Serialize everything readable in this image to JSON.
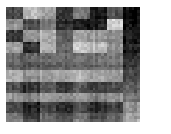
{
  "figure": {
    "background_color": "#ffffff",
    "plot_area": {
      "left": 6,
      "top": 7,
      "width": 134,
      "height": 115
    },
    "title": "",
    "xlabel": "",
    "ylabel": ""
  },
  "chart_data": {
    "type": "heatmap",
    "title": "",
    "subtitle": "",
    "xlabel": "",
    "ylabel": "",
    "grid": false,
    "legend": "none",
    "colormap": "gray",
    "vmin": 0,
    "vmax": 1,
    "n_rows": 40,
    "n_cols": 48,
    "xtick_labels": [],
    "ytick_labels": [],
    "annotations": [],
    "row_bands": [
      {
        "index": 0,
        "rows": [
          0,
          3
        ],
        "label": "band-1"
      },
      {
        "index": 1,
        "rows": [
          4,
          7
        ],
        "label": "band-2"
      },
      {
        "index": 2,
        "rows": [
          8,
          11
        ],
        "label": "band-3"
      },
      {
        "index": 3,
        "rows": [
          12,
          15
        ],
        "label": "band-4"
      },
      {
        "index": 4,
        "rows": [
          16,
          18
        ],
        "label": "band-5"
      },
      {
        "index": 5,
        "rows": [
          19,
          21
        ],
        "label": "band-6"
      },
      {
        "index": 6,
        "rows": [
          22,
          25
        ],
        "label": "band-7"
      },
      {
        "index": 7,
        "rows": [
          26,
          29
        ],
        "label": "band-8"
      },
      {
        "index": 8,
        "rows": [
          30,
          32
        ],
        "label": "band-9"
      },
      {
        "index": 9,
        "rows": [
          33,
          36
        ],
        "label": "band-10"
      },
      {
        "index": 10,
        "rows": [
          37,
          39
        ],
        "label": "band-11"
      }
    ],
    "col_blocks": [
      {
        "index": 0,
        "cols": [
          0,
          5
        ],
        "label": "block-1"
      },
      {
        "index": 1,
        "cols": [
          6,
          11
        ],
        "label": "block-2"
      },
      {
        "index": 2,
        "cols": [
          12,
          17
        ],
        "label": "block-3"
      },
      {
        "index": 3,
        "cols": [
          18,
          23
        ],
        "label": "block-4"
      },
      {
        "index": 4,
        "cols": [
          24,
          29
        ],
        "label": "block-5"
      },
      {
        "index": 5,
        "cols": [
          30,
          35
        ],
        "label": "block-6"
      },
      {
        "index": 6,
        "cols": [
          36,
          41
        ],
        "label": "block-7"
      },
      {
        "index": 7,
        "cols": [
          42,
          47
        ],
        "label": "block-8-dark"
      }
    ],
    "block_values": [
      [
        0.28,
        0.72,
        0.62,
        0.18,
        0.45,
        0.08,
        0.3,
        0.05
      ],
      [
        0.55,
        0.3,
        0.48,
        0.17,
        0.1,
        0.12,
        0.8,
        0.06
      ],
      [
        0.22,
        0.58,
        0.68,
        0.35,
        0.62,
        0.6,
        0.52,
        0.1
      ],
      [
        0.62,
        0.18,
        0.7,
        0.4,
        0.78,
        0.74,
        0.55,
        0.14
      ],
      [
        0.4,
        0.38,
        0.42,
        0.4,
        0.42,
        0.44,
        0.46,
        0.2
      ],
      [
        0.36,
        0.34,
        0.38,
        0.36,
        0.38,
        0.4,
        0.42,
        0.22
      ],
      [
        0.7,
        0.6,
        0.66,
        0.64,
        0.72,
        0.66,
        0.62,
        0.3
      ],
      [
        0.32,
        0.2,
        0.36,
        0.22,
        0.34,
        0.24,
        0.3,
        0.38
      ],
      [
        0.58,
        0.5,
        0.6,
        0.52,
        0.58,
        0.5,
        0.56,
        0.46
      ],
      [
        0.24,
        0.12,
        0.28,
        0.14,
        0.26,
        0.16,
        0.22,
        0.56
      ],
      [
        0.48,
        0.26,
        0.44,
        0.3,
        0.46,
        0.32,
        0.4,
        0.66
      ]
    ],
    "noise_amplitude": 0.07,
    "column_stripe_amplitude": 0.05
  }
}
